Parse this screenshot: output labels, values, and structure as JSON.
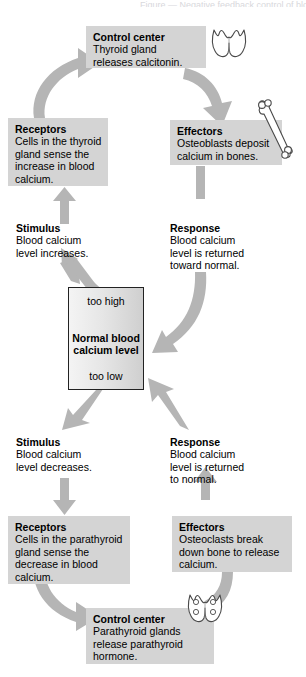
{
  "diagram": {
    "title_partial": "Figure — Negative feedback control of blood calcium",
    "accent_gray": "#d4d4d4",
    "arrow_gray": "#b3b3b3",
    "arrow_gray_dark": "#a3a3a3",
    "central": {
      "too_high": "too high",
      "normal_line1": "Normal blood",
      "normal_line2": "calcium level",
      "too_low": "too low"
    },
    "nodes": {
      "control_center_top": {
        "heading": "Control center",
        "body_line1": "Thyroid gland",
        "body_line2": "releases calcitonin.",
        "icon": "thyroid-gland-icon"
      },
      "receptors_top": {
        "heading": "Receptors",
        "body_line1": "Cells in the thyroid",
        "body_line2": "gland sense the",
        "body_line3": "increase in blood",
        "body_line4": "calcium."
      },
      "effectors_top": {
        "heading": "Effectors",
        "body_line1": "Osteoblasts deposit",
        "body_line2": "calcium in bones.",
        "icon": "bone-icon"
      },
      "stimulus_top": {
        "heading": "Stimulus",
        "body_line1": "Blood calcium",
        "body_line2": "level increases."
      },
      "response_top": {
        "heading": "Response",
        "body_line1": "Blood calcium",
        "body_line2": "level is returned",
        "body_line3": "toward normal."
      },
      "stimulus_bottom": {
        "heading": "Stimulus",
        "body_line1": "Blood calcium",
        "body_line2": "level decreases."
      },
      "response_bottom": {
        "heading": "Response",
        "body_line1": "Blood calcium",
        "body_line2": "level is returned",
        "body_line3": "to normal."
      },
      "receptors_bottom": {
        "heading": "Receptors",
        "body_line1": "Cells in the parathyroid",
        "body_line2": "gland sense the",
        "body_line3": "decrease in blood",
        "body_line4": "calcium."
      },
      "effectors_bottom": {
        "heading": "Effectors",
        "body_line1": "Osteoclasts break",
        "body_line2": "down bone to release",
        "body_line3": "calcium."
      },
      "control_center_bottom": {
        "heading": "Control center",
        "body_line1": "Parathyroid glands",
        "body_line2": "release parathyroid",
        "body_line3": "hormone.",
        "icon": "parathyroid-gland-icon"
      }
    }
  }
}
